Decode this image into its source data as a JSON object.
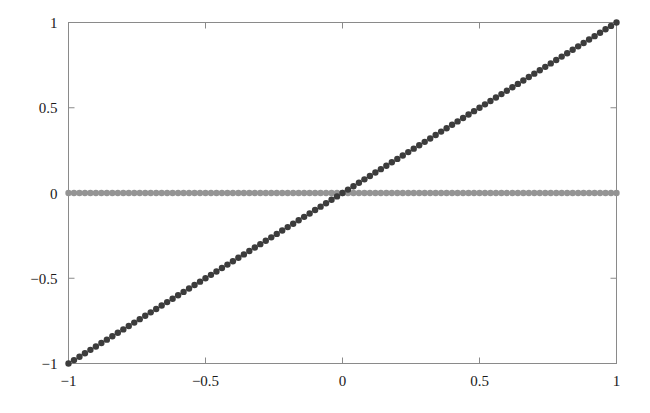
{
  "figure": {
    "background_color": "#ffffff",
    "frame_color": "#8a8a8a",
    "width": 650,
    "height": 413
  },
  "chart_data": {
    "type": "scatter",
    "title": "",
    "subtitle": "",
    "xlabel": "",
    "ylabel": "",
    "xlim": [
      -1,
      1
    ],
    "ylim": [
      -1,
      1
    ],
    "grid": false,
    "legend": false,
    "legend_position": "none",
    "frame": true,
    "tick_direction": "inward",
    "marker": "circle",
    "marker_size_px": 3.2,
    "xticks": [
      -1,
      -0.5,
      0,
      0.5,
      1
    ],
    "xticklabels": [
      "-1",
      "-0.5",
      "0",
      "0.5",
      "1"
    ],
    "yticks": [
      -1,
      -0.5,
      0,
      0.5,
      1
    ],
    "yticklabels": [
      "-1",
      "-0.5",
      "0",
      "0.5",
      "1"
    ],
    "n_points": 101,
    "series": [
      {
        "name": "identity",
        "expression": "y = x",
        "color": "#3c3c3c",
        "x": [
          -1,
          -0.98,
          -0.96,
          -0.94,
          -0.92,
          -0.9,
          -0.88,
          -0.86,
          -0.84,
          -0.82,
          -0.8,
          -0.78,
          -0.76,
          -0.74,
          -0.72,
          -0.7,
          -0.68,
          -0.66,
          -0.64,
          -0.62,
          -0.6,
          -0.58,
          -0.56,
          -0.54,
          -0.52,
          -0.5,
          -0.48,
          -0.46,
          -0.44,
          -0.42,
          -0.4,
          -0.38,
          -0.36,
          -0.34,
          -0.32,
          -0.3,
          -0.28,
          -0.26,
          -0.24,
          -0.22,
          -0.2,
          -0.18,
          -0.16,
          -0.14,
          -0.12,
          -0.1,
          -0.08,
          -0.06,
          -0.04,
          -0.02,
          0,
          0.02,
          0.04,
          0.06,
          0.08,
          0.1,
          0.12,
          0.14,
          0.16,
          0.18,
          0.2,
          0.22,
          0.24,
          0.26,
          0.28,
          0.3,
          0.32,
          0.34,
          0.36,
          0.38,
          0.4,
          0.42,
          0.44,
          0.46,
          0.48,
          0.5,
          0.52,
          0.54,
          0.56,
          0.58,
          0.6,
          0.62,
          0.64,
          0.66,
          0.68,
          0.7,
          0.72,
          0.74,
          0.76,
          0.78,
          0.8,
          0.82,
          0.84,
          0.86,
          0.88,
          0.9,
          0.92,
          0.94,
          0.96,
          0.98,
          1
        ],
        "y": [
          -1,
          -0.98,
          -0.96,
          -0.94,
          -0.92,
          -0.9,
          -0.88,
          -0.86,
          -0.84,
          -0.82,
          -0.8,
          -0.78,
          -0.76,
          -0.74,
          -0.72,
          -0.7,
          -0.68,
          -0.66,
          -0.64,
          -0.62,
          -0.6,
          -0.58,
          -0.56,
          -0.54,
          -0.52,
          -0.5,
          -0.48,
          -0.46,
          -0.44,
          -0.42,
          -0.4,
          -0.38,
          -0.36,
          -0.34,
          -0.32,
          -0.3,
          -0.28,
          -0.26,
          -0.24,
          -0.22,
          -0.2,
          -0.18,
          -0.16,
          -0.14,
          -0.12,
          -0.1,
          -0.08,
          -0.06,
          -0.04,
          -0.02,
          0,
          0.02,
          0.04,
          0.06,
          0.08,
          0.1,
          0.12,
          0.14,
          0.16,
          0.18,
          0.2,
          0.22,
          0.24,
          0.26,
          0.28,
          0.3,
          0.32,
          0.34,
          0.36,
          0.38,
          0.4,
          0.42,
          0.44,
          0.46,
          0.48,
          0.5,
          0.52,
          0.54,
          0.56,
          0.58,
          0.6,
          0.62,
          0.64,
          0.66,
          0.68,
          0.7,
          0.72,
          0.74,
          0.76,
          0.78,
          0.8,
          0.82,
          0.84,
          0.86,
          0.88,
          0.9,
          0.92,
          0.94,
          0.96,
          0.98,
          1
        ]
      },
      {
        "name": "zero",
        "expression": "y = 0",
        "color": "#949494",
        "x": [
          -1,
          -0.98,
          -0.96,
          -0.94,
          -0.92,
          -0.9,
          -0.88,
          -0.86,
          -0.84,
          -0.82,
          -0.8,
          -0.78,
          -0.76,
          -0.74,
          -0.72,
          -0.7,
          -0.68,
          -0.66,
          -0.64,
          -0.62,
          -0.6,
          -0.58,
          -0.56,
          -0.54,
          -0.52,
          -0.5,
          -0.48,
          -0.46,
          -0.44,
          -0.42,
          -0.4,
          -0.38,
          -0.36,
          -0.34,
          -0.32,
          -0.3,
          -0.28,
          -0.26,
          -0.24,
          -0.22,
          -0.2,
          -0.18,
          -0.16,
          -0.14,
          -0.12,
          -0.1,
          -0.08,
          -0.06,
          -0.04,
          -0.02,
          0,
          0.02,
          0.04,
          0.06,
          0.08,
          0.1,
          0.12,
          0.14,
          0.16,
          0.18,
          0.2,
          0.22,
          0.24,
          0.26,
          0.28,
          0.3,
          0.32,
          0.34,
          0.36,
          0.38,
          0.4,
          0.42,
          0.44,
          0.46,
          0.48,
          0.5,
          0.52,
          0.54,
          0.56,
          0.58,
          0.6,
          0.62,
          0.64,
          0.66,
          0.68,
          0.7,
          0.72,
          0.74,
          0.76,
          0.78,
          0.8,
          0.82,
          0.84,
          0.86,
          0.88,
          0.9,
          0.92,
          0.94,
          0.96,
          0.98,
          1
        ],
        "y": [
          0,
          0,
          0,
          0,
          0,
          0,
          0,
          0,
          0,
          0,
          0,
          0,
          0,
          0,
          0,
          0,
          0,
          0,
          0,
          0,
          0,
          0,
          0,
          0,
          0,
          0,
          0,
          0,
          0,
          0,
          0,
          0,
          0,
          0,
          0,
          0,
          0,
          0,
          0,
          0,
          0,
          0,
          0,
          0,
          0,
          0,
          0,
          0,
          0,
          0,
          0,
          0,
          0,
          0,
          0,
          0,
          0,
          0,
          0,
          0,
          0,
          0,
          0,
          0,
          0,
          0,
          0,
          0,
          0,
          0,
          0,
          0,
          0,
          0,
          0,
          0,
          0,
          0,
          0,
          0,
          0,
          0,
          0,
          0,
          0,
          0,
          0,
          0,
          0,
          0,
          0,
          0,
          0,
          0,
          0,
          0,
          0,
          0,
          0,
          0,
          0
        ]
      }
    ]
  }
}
